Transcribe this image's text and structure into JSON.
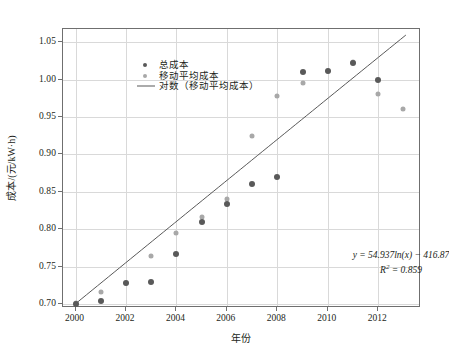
{
  "chart_data": {
    "type": "scatter",
    "title": "",
    "xlabel": "年份",
    "ylabel": "成本/(元/kW·h)",
    "xlim": [
      1999.5,
      2013.7
    ],
    "ylim": [
      0.695,
      1.0675
    ],
    "grid": true,
    "legend_position": "top-left",
    "xticks": [
      "2000",
      "2002",
      "2004",
      "2006",
      "2008",
      "2010",
      "2012"
    ],
    "xtick_values": [
      2000,
      2002,
      2004,
      2006,
      2008,
      2010,
      2012
    ],
    "yticks": [
      "0.70",
      "0.75",
      "0.80",
      "0.85",
      "0.90",
      "0.95",
      "1.00",
      "1.05"
    ],
    "ytick_values": [
      0.7,
      0.75,
      0.8,
      0.85,
      0.9,
      0.95,
      1.0,
      1.05
    ],
    "series": [
      {
        "name": "总成本",
        "marker": "circle",
        "color": "#595959",
        "points": [
          {
            "x": 2000,
            "y": 0.7
          },
          {
            "x": 2001,
            "y": 0.705
          },
          {
            "x": 2002,
            "y": 0.729
          },
          {
            "x": 2003,
            "y": 0.73
          },
          {
            "x": 2004,
            "y": 0.767
          },
          {
            "x": 2005,
            "y": 0.81
          },
          {
            "x": 2006,
            "y": 0.834
          },
          {
            "x": 2007,
            "y": 0.861
          },
          {
            "x": 2008,
            "y": 0.87
          },
          {
            "x": 2009,
            "y": 1.01
          },
          {
            "x": 2010,
            "y": 1.012
          },
          {
            "x": 2011,
            "y": 1.022
          },
          {
            "x": 2012,
            "y": 0.999
          }
        ]
      },
      {
        "name": "移动平均成本",
        "marker": "circle",
        "color": "#a8a8a8",
        "points": [
          {
            "x": 2000,
            "y": 0.702
          },
          {
            "x": 2001,
            "y": 0.716
          },
          {
            "x": 2002,
            "y": 0.728
          },
          {
            "x": 2003,
            "y": 0.765
          },
          {
            "x": 2004,
            "y": 0.795
          },
          {
            "x": 2005,
            "y": 0.816
          },
          {
            "x": 2006,
            "y": 0.84
          },
          {
            "x": 2007,
            "y": 0.925
          },
          {
            "x": 2008,
            "y": 0.978
          },
          {
            "x": 2009,
            "y": 0.996
          },
          {
            "x": 2010,
            "y": 1.012
          },
          {
            "x": 2011,
            "y": 1.023
          },
          {
            "x": 2012,
            "y": 0.981
          },
          {
            "x": 2013,
            "y": 0.961
          }
        ]
      }
    ],
    "trendline": {
      "name": "对数（移动平均成本）",
      "color": "#595959",
      "equation": "y = 54.937ln(x) − 416.87",
      "r_squared_label": "R",
      "r_squared_exp": "2",
      "r_squared_value": "= 0.859",
      "formula_type": "logarithmic",
      "coef": 54.937,
      "intercept": -416.87,
      "x_start": 2000,
      "x_end": 2013.1
    }
  },
  "legend": {
    "items": [
      {
        "label": "总成本",
        "key": "dot",
        "color": "#595959"
      },
      {
        "label": "移动平均成本",
        "key": "dot",
        "color": "#a8a8a8"
      },
      {
        "label": "对数（移动平均成本）",
        "key": "line",
        "color": "#595959"
      }
    ]
  },
  "annotation": {
    "line1": "y = 54.937ln(x) − 416.87",
    "line2_base": "R",
    "line2_sup": "2",
    "line2_rest": " = 0.859"
  },
  "axes": {
    "x_title": "年份",
    "y_title": "成本/(元/kW·h)"
  }
}
